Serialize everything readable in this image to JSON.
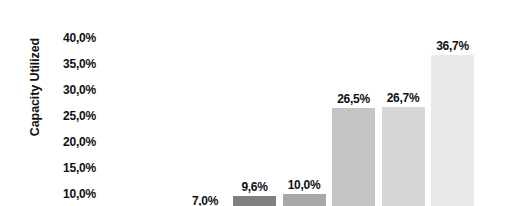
{
  "chart_data": {
    "type": "bar",
    "title": "",
    "xlabel": "",
    "ylabel": "Capacity Utilized",
    "ylim": [
      10.0,
      40.0
    ],
    "grid": false,
    "legend": "none",
    "value_suffix": "%",
    "decimal_separator": ",",
    "ytick_labels": [
      "40,0%",
      "35,0%",
      "30,0%",
      "25,0%",
      "20,0%",
      "15,0%",
      "10,0%"
    ],
    "ytick_values": [
      40.0,
      35.0,
      30.0,
      25.0,
      20.0,
      15.0,
      10.0
    ],
    "categories": [
      "",
      "",
      "",
      "",
      "",
      ""
    ],
    "values": [
      7.0,
      9.6,
      10.0,
      26.5,
      26.7,
      36.7
    ],
    "data_labels": [
      "7,0%",
      "9,6%",
      "10,0%",
      "26,5%",
      "26,7%",
      "36,7%"
    ],
    "bar_colors": [
      "#b4b4b4",
      "#808080",
      "#a8a8a8",
      "#c4c4c4",
      "#d6d6d6",
      "#e9e9e9"
    ]
  },
  "axis": {
    "y_label": "Capacity Utilized"
  }
}
